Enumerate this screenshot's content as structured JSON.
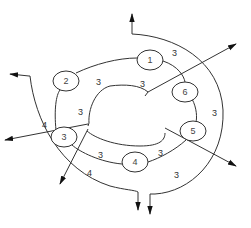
{
  "diagram": {
    "type": "network-ring",
    "nodes": [
      {
        "id": "1",
        "label": "1",
        "cx": 150,
        "cy": 60
      },
      {
        "id": "2",
        "label": "2",
        "cx": 66,
        "cy": 81
      },
      {
        "id": "3",
        "label": "3",
        "cx": 64,
        "cy": 137
      },
      {
        "id": "4",
        "label": "4",
        "cx": 135,
        "cy": 162
      },
      {
        "id": "5",
        "label": "5",
        "cx": 193,
        "cy": 131
      },
      {
        "id": "6",
        "label": "6",
        "cx": 185,
        "cy": 92
      }
    ],
    "edge_labels": [
      {
        "text": "3",
        "x": 172,
        "y": 56,
        "note": "outer top arc"
      },
      {
        "text": "3",
        "x": 96,
        "y": 85,
        "note": "inner ring top-left"
      },
      {
        "text": "3",
        "x": 140,
        "y": 87,
        "note": "inner ring top-right"
      },
      {
        "text": "3",
        "x": 78,
        "y": 115,
        "note": "inner ring left"
      },
      {
        "text": "4",
        "x": 42,
        "y": 128,
        "note": "outer left arc"
      },
      {
        "text": "3",
        "x": 98,
        "y": 158,
        "note": "ring 3-4"
      },
      {
        "text": "3",
        "x": 158,
        "y": 156,
        "note": "ring 4-5"
      },
      {
        "text": "4",
        "x": 87,
        "y": 176,
        "note": "outer bottom-left arc"
      },
      {
        "text": "3",
        "x": 174,
        "y": 178,
        "note": "outer bottom-right arc"
      },
      {
        "text": "3",
        "x": 212,
        "y": 116,
        "note": "outer right arc"
      }
    ],
    "arrows": [
      {
        "name": "top-arrow",
        "direction": "up"
      },
      {
        "name": "upper-left-arrow",
        "direction": "left"
      },
      {
        "name": "upper-right-arrow",
        "direction": "up-right"
      },
      {
        "name": "left-arrow",
        "direction": "left"
      },
      {
        "name": "lower-left-arrow",
        "direction": "down"
      },
      {
        "name": "right-arrow",
        "direction": "down-right"
      },
      {
        "name": "bottom-arrow-1",
        "direction": "down"
      },
      {
        "name": "bottom-arrow-2",
        "direction": "down"
      }
    ]
  }
}
